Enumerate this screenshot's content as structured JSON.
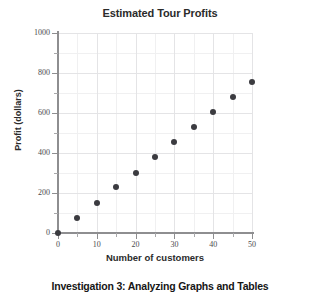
{
  "chart_data": {
    "type": "scatter",
    "title": "Estimated Tour Profits",
    "xlabel": "Number of customers",
    "ylabel": "Profit (dollars)",
    "x": [
      0,
      5,
      10,
      15,
      20,
      25,
      30,
      35,
      40,
      45,
      50
    ],
    "values": [
      0,
      75,
      150,
      228,
      302,
      378,
      455,
      530,
      607,
      682,
      757
    ],
    "xlim": [
      0,
      50
    ],
    "ylim": [
      0,
      1000
    ],
    "xticks": [
      0,
      10,
      20,
      30,
      40,
      50
    ],
    "xtick_labels": [
      "0",
      "10",
      "20",
      "30",
      "40",
      "50"
    ],
    "xticks_minor": [
      5,
      15,
      25,
      35,
      45
    ],
    "yticks": [
      0,
      200,
      400,
      600,
      800,
      1000
    ],
    "ytick_labels": [
      "0",
      "200",
      "400",
      "600",
      "800",
      "1000"
    ],
    "yticks_minor": [
      100,
      300,
      500,
      700,
      900
    ],
    "grid": true,
    "legend": false,
    "marker_color": "#3b3b40",
    "grid_color": "#e4e4e6",
    "axis_color": "#8e8e90"
  },
  "caption": {
    "text": "Investigation 3: Analyzing Graphs and Tables"
  }
}
